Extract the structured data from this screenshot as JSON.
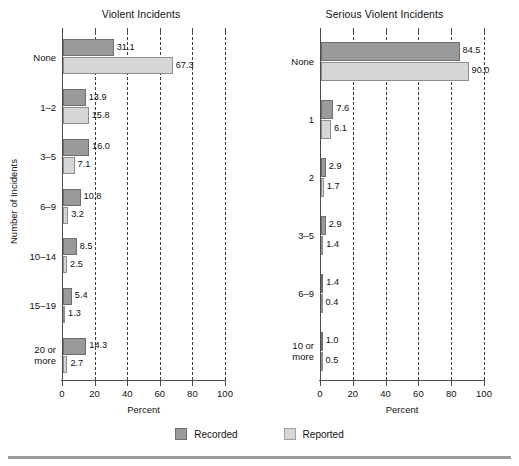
{
  "figure": {
    "legend": [
      {
        "key": "recorded",
        "label": "Recorded",
        "color": "#9a9a9a"
      },
      {
        "key": "reported",
        "label": "Reported",
        "color": "#d6d6d6"
      }
    ],
    "ylabel": "Number of Incidents",
    "xlabel": "Percent"
  },
  "chart_data": [
    {
      "type": "bar",
      "orientation": "horizontal",
      "title": "Violent Incidents",
      "xlabel": "Percent",
      "ylabel": "Number of Incidents",
      "xlim": [
        0,
        100
      ],
      "xticks": [
        0,
        20,
        40,
        60,
        80,
        100
      ],
      "grid": "vertical-dashed",
      "legend_position": "bottom-center",
      "categories": [
        "None",
        "1–2",
        "3–5",
        "6–9",
        "10–14",
        "15–19",
        "20 or\nmore"
      ],
      "series": [
        {
          "name": "Recorded",
          "color": "#9a9a9a",
          "values": [
            31.1,
            13.9,
            16.0,
            10.8,
            8.5,
            5.4,
            14.3
          ]
        },
        {
          "name": "Reported",
          "color": "#d6d6d6",
          "values": [
            67.3,
            15.8,
            7.1,
            3.2,
            2.5,
            1.3,
            2.7
          ]
        }
      ]
    },
    {
      "type": "bar",
      "orientation": "horizontal",
      "title": "Serious Violent Incidents",
      "xlabel": "Percent",
      "ylabel": "",
      "xlim": [
        0,
        100
      ],
      "xticks": [
        0,
        20,
        40,
        60,
        80,
        100
      ],
      "grid": "vertical-dashed",
      "legend_position": "bottom-center",
      "categories": [
        "None",
        "1",
        "2",
        "3–5",
        "6–9",
        "10 or\nmore"
      ],
      "series": [
        {
          "name": "Recorded",
          "color": "#9a9a9a",
          "values": [
            84.5,
            7.6,
            2.9,
            2.9,
            1.4,
            1.0
          ]
        },
        {
          "name": "Reported",
          "color": "#d6d6d6",
          "values": [
            90.0,
            6.1,
            1.7,
            1.4,
            0.4,
            0.5
          ]
        }
      ]
    }
  ],
  "labels": {
    "left": {
      "recorded_text": [
        "31.1",
        "13.9",
        "16.0",
        "10.8",
        "8.5",
        "5.4",
        "14.3"
      ],
      "reported_text": [
        "67.3",
        "15.8",
        "7.1",
        "3.2",
        "2.5",
        "1.3",
        "2.7"
      ]
    },
    "right": {
      "recorded_text": [
        "84.5",
        "7.6",
        "2.9",
        "2.9",
        "1.4",
        "1.0"
      ],
      "reported_text": [
        "90.0",
        "6.1",
        "1.7",
        "1.4",
        "0.4",
        "0.5"
      ]
    }
  }
}
